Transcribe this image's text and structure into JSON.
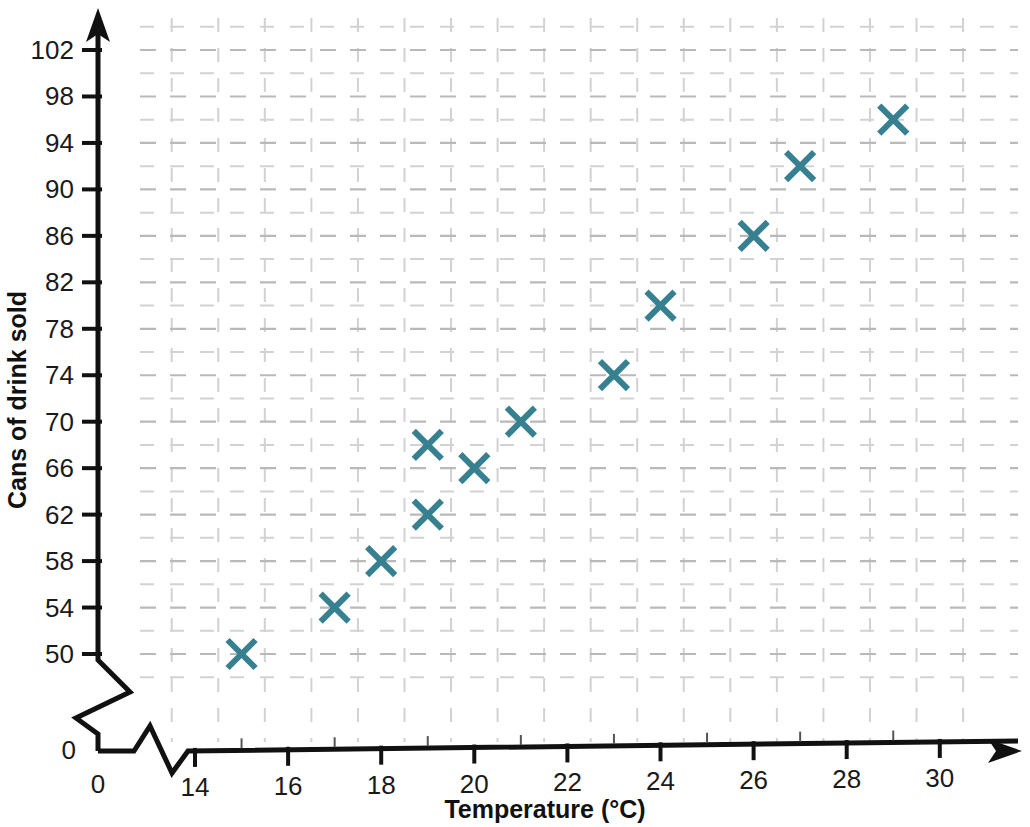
{
  "chart_data": {
    "type": "scatter",
    "title": "",
    "xlabel": "Temperature (°C)",
    "ylabel": "Cans of drink sold",
    "x": [
      15,
      17,
      18,
      19,
      19,
      20,
      21,
      23,
      24,
      26,
      27,
      29
    ],
    "y": [
      50,
      54,
      58,
      62,
      68,
      66,
      70,
      74,
      80,
      86,
      92,
      96
    ],
    "points": [
      {
        "x": 15,
        "y": 50
      },
      {
        "x": 17,
        "y": 54
      },
      {
        "x": 18,
        "y": 58
      },
      {
        "x": 19,
        "y": 62
      },
      {
        "x": 19,
        "y": 68
      },
      {
        "x": 20,
        "y": 66
      },
      {
        "x": 21,
        "y": 70
      },
      {
        "x": 23,
        "y": 74
      },
      {
        "x": 24,
        "y": 80
      },
      {
        "x": 26,
        "y": 86
      },
      {
        "x": 27,
        "y": 92
      },
      {
        "x": 29,
        "y": 96
      }
    ],
    "marker": "x-cross",
    "marker_color": "#37808f",
    "xlim": [
      14,
      31
    ],
    "ylim": [
      50,
      104
    ],
    "x_ticks": [
      14,
      16,
      18,
      20,
      22,
      24,
      26,
      28,
      30
    ],
    "x_tick_labels": [
      "14",
      "16",
      "18",
      "20",
      "22",
      "24",
      "26",
      "28",
      "30"
    ],
    "x_minor_step": 1,
    "y_ticks": [
      50,
      54,
      58,
      62,
      66,
      70,
      74,
      78,
      82,
      86,
      90,
      94,
      98,
      102
    ],
    "y_tick_labels": [
      "50",
      "54",
      "58",
      "62",
      "66",
      "70",
      "74",
      "78",
      "82",
      "86",
      "90",
      "94",
      "98",
      "102"
    ],
    "y_minor_step": 2,
    "origin_label_x": "0",
    "origin_label_y": "0",
    "axis_break_x": true,
    "axis_break_y": true,
    "grid": true,
    "grid_style": "dashed",
    "grid_color": "#bdbdbd",
    "legend": "none",
    "axis_color": "#111111",
    "background_color": "#ffffff"
  },
  "axes": {
    "x_title": "Temperature (°C)",
    "y_title": "Cans of drink sold"
  }
}
